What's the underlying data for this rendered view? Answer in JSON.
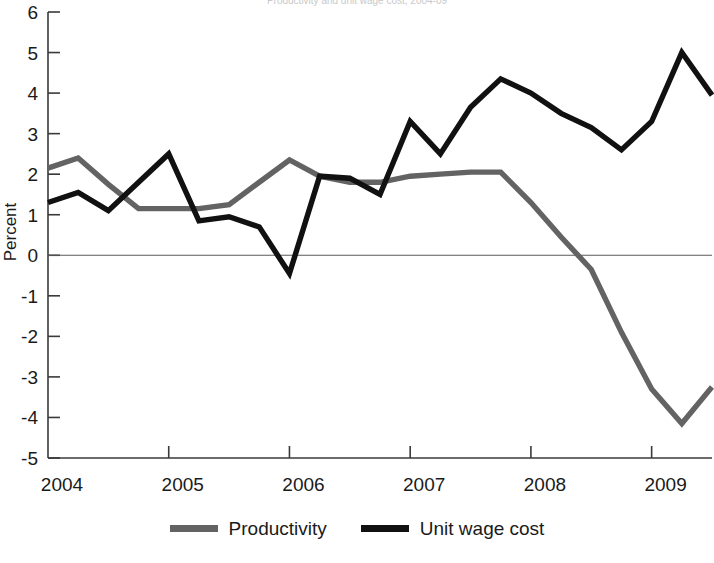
{
  "chart_data": {
    "type": "line",
    "title": "Productivity and unit wage cost, 2004-09",
    "xlabel": "",
    "ylabel": "Percent",
    "ylim": [
      -5,
      6
    ],
    "ytick_labels": [
      "6",
      "5",
      "4",
      "3",
      "2",
      "1",
      "0",
      "-1",
      "-2",
      "-3",
      "-4",
      "-5"
    ],
    "ytick_values": [
      6,
      5,
      4,
      3,
      2,
      1,
      0,
      -1,
      -2,
      -3,
      -4,
      -5
    ],
    "xtick_labels": [
      "2004",
      "2005",
      "2006",
      "2007",
      "2008",
      "2009"
    ],
    "xtick_values": [
      2004,
      2005,
      2006,
      2007,
      2008,
      2009
    ],
    "grid": false,
    "zero_line": true,
    "legend_position": "bottom",
    "x": [
      2004.0,
      2004.25,
      2004.5,
      2004.75,
      2005.0,
      2005.25,
      2005.5,
      2005.75,
      2006.0,
      2006.25,
      2006.5,
      2006.75,
      2007.0,
      2007.25,
      2007.5,
      2007.75,
      2008.0,
      2008.25,
      2008.5,
      2008.75,
      2009.0,
      2009.25,
      2009.5
    ],
    "series": [
      {
        "name": "Productivity",
        "color": "#636363",
        "values": [
          2.15,
          2.4,
          1.75,
          1.15,
          1.15,
          1.15,
          1.25,
          1.8,
          2.35,
          1.95,
          1.8,
          1.8,
          1.95,
          2.0,
          2.05,
          2.05,
          1.3,
          0.45,
          -0.35,
          -1.9,
          -3.3,
          -4.15,
          -3.25
        ]
      },
      {
        "name": "Unit wage cost",
        "color": "#111111",
        "values": [
          1.3,
          1.55,
          1.1,
          1.8,
          2.5,
          0.85,
          0.95,
          0.7,
          -0.45,
          1.95,
          1.9,
          1.5,
          3.3,
          2.5,
          3.65,
          4.35,
          4.0,
          3.5,
          3.15,
          2.6,
          3.3,
          5.0,
          3.95
        ]
      }
    ]
  },
  "legend": {
    "items": [
      {
        "label": "Productivity",
        "color": "#636363"
      },
      {
        "label": "Unit wage cost",
        "color": "#111111"
      }
    ]
  },
  "axes": {
    "y_axis_title": "Percent"
  }
}
